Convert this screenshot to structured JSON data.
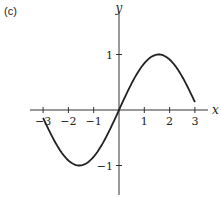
{
  "panel_label": "(c)",
  "chart_data": {
    "type": "line",
    "title": "",
    "xlabel": "x",
    "ylabel": "y",
    "xlim": [
      -3.5,
      3.6
    ],
    "ylim": [
      -1.5,
      1.6
    ],
    "grid": false,
    "legend": null,
    "x_ticks": [
      -3,
      -2,
      -1,
      1,
      2,
      3
    ],
    "x_tick_labels": [
      "−3",
      "−2",
      "−1",
      "1",
      "2",
      "3"
    ],
    "y_ticks": [
      1,
      -1
    ],
    "y_tick_labels": [
      "1",
      "−1"
    ],
    "series": [
      {
        "name": "y = sin(x)",
        "function": "sin",
        "domain": [
          -3,
          3
        ],
        "x": [
          -3,
          -2.5,
          -2,
          -1.5708,
          -1,
          -0.5,
          0,
          0.5,
          1,
          1.5708,
          2,
          2.5,
          3
        ],
        "y": [
          -0.14,
          -0.6,
          -0.91,
          -1,
          -0.84,
          -0.48,
          0,
          0.48,
          0.84,
          1,
          0.91,
          0.6,
          0.14
        ],
        "color": "#222222"
      }
    ]
  },
  "layout": {
    "origin_px": [
      119,
      110
    ],
    "x_unit_px": 25.3,
    "y_unit_px": 55.5,
    "x_axis_px": [
      30,
      208
    ],
    "y_axis_px": [
      12,
      195
    ]
  }
}
